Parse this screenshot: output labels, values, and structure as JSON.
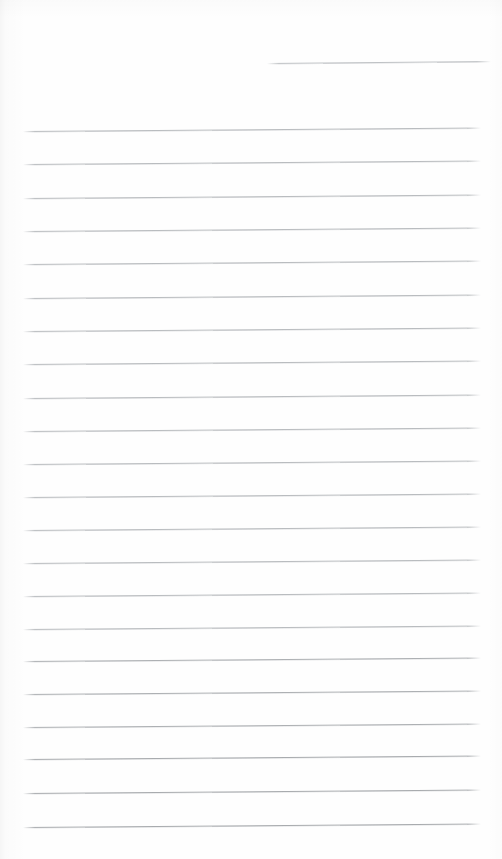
{
  "document": {
    "kind": "scanned-lined-notepaper",
    "page_width": 502,
    "page_height": 859,
    "background_color": "#fefefe",
    "rule_color": "#b9bcbf",
    "text_content": "",
    "handwriting_present": "no",
    "visible_text_count": 0
  },
  "rules": {
    "count": 23,
    "body_count": 22,
    "header_count": 1,
    "body_left_x": 23,
    "body_right_x": 481,
    "body_spacing_px": 33.4,
    "items": [
      {
        "id": "header-rule",
        "x": 267,
        "y": 63,
        "width": 224,
        "slant_deg": -0.5,
        "weight": 1,
        "tone": "#bfc2c5"
      },
      {
        "id": "body-rule-1",
        "x": 23,
        "y": 131,
        "width": 458,
        "slant_deg": -0.45,
        "weight": 1,
        "tone": "#b9bcbf"
      },
      {
        "id": "body-rule-2",
        "x": 23,
        "y": 164,
        "width": 458,
        "slant_deg": -0.45,
        "weight": 1,
        "tone": "#b9bcbf"
      },
      {
        "id": "body-rule-3",
        "x": 23,
        "y": 198,
        "width": 458,
        "slant_deg": -0.45,
        "weight": 1,
        "tone": "#b9bcbf"
      },
      {
        "id": "body-rule-4",
        "x": 23,
        "y": 231,
        "width": 458,
        "slant_deg": -0.45,
        "weight": 1,
        "tone": "#b9bcbf"
      },
      {
        "id": "body-rule-5",
        "x": 23,
        "y": 264,
        "width": 458,
        "slant_deg": -0.45,
        "weight": 1,
        "tone": "#b9bcbf"
      },
      {
        "id": "body-rule-6",
        "x": 23,
        "y": 298,
        "width": 458,
        "slant_deg": -0.45,
        "weight": 1,
        "tone": "#b9bcbf"
      },
      {
        "id": "body-rule-7",
        "x": 23,
        "y": 331,
        "width": 458,
        "slant_deg": -0.45,
        "weight": 1,
        "tone": "#b9bcbf"
      },
      {
        "id": "body-rule-8",
        "x": 23,
        "y": 364,
        "width": 458,
        "slant_deg": -0.45,
        "weight": 1,
        "tone": "#b9bcbf"
      },
      {
        "id": "body-rule-9",
        "x": 23,
        "y": 398,
        "width": 458,
        "slant_deg": -0.45,
        "weight": 1,
        "tone": "#b9bcbf"
      },
      {
        "id": "body-rule-10",
        "x": 23,
        "y": 431,
        "width": 458,
        "slant_deg": -0.45,
        "weight": 1,
        "tone": "#b9bcbf"
      },
      {
        "id": "body-rule-11",
        "x": 23,
        "y": 464,
        "width": 458,
        "slant_deg": -0.45,
        "weight": 1,
        "tone": "#b9bcbf"
      },
      {
        "id": "body-rule-12",
        "x": 23,
        "y": 497,
        "width": 458,
        "slant_deg": -0.45,
        "weight": 1,
        "tone": "#b9bcbf"
      },
      {
        "id": "body-rule-13",
        "x": 23,
        "y": 530,
        "width": 458,
        "slant_deg": -0.45,
        "weight": 1,
        "tone": "#b9bcbf"
      },
      {
        "id": "body-rule-14",
        "x": 23,
        "y": 563,
        "width": 458,
        "slant_deg": -0.45,
        "weight": 1,
        "tone": "#b9bcbf"
      },
      {
        "id": "body-rule-15",
        "x": 23,
        "y": 596,
        "width": 458,
        "slant_deg": -0.45,
        "weight": 1,
        "tone": "#b9bcbf"
      },
      {
        "id": "body-rule-16",
        "x": 23,
        "y": 629,
        "width": 458,
        "slant_deg": -0.45,
        "weight": 1,
        "tone": "#b9bcbf"
      },
      {
        "id": "body-rule-17",
        "x": 23,
        "y": 661,
        "width": 458,
        "slant_deg": -0.45,
        "weight": 1,
        "tone": "#adb0b3"
      },
      {
        "id": "body-rule-18",
        "x": 23,
        "y": 694,
        "width": 458,
        "slant_deg": -0.45,
        "weight": 1,
        "tone": "#adb0b3"
      },
      {
        "id": "body-rule-19",
        "x": 23,
        "y": 727,
        "width": 458,
        "slant_deg": -0.45,
        "weight": 1,
        "tone": "#adb0b3"
      },
      {
        "id": "body-rule-20",
        "x": 23,
        "y": 759,
        "width": 458,
        "slant_deg": -0.45,
        "weight": 1,
        "tone": "#a8abae"
      },
      {
        "id": "body-rule-21",
        "x": 23,
        "y": 793,
        "width": 458,
        "slant_deg": -0.45,
        "weight": 1,
        "tone": "#a8abae"
      },
      {
        "id": "body-rule-22",
        "x": 23,
        "y": 827,
        "width": 458,
        "slant_deg": -0.45,
        "weight": 1,
        "tone": "#a8abae"
      }
    ]
  }
}
